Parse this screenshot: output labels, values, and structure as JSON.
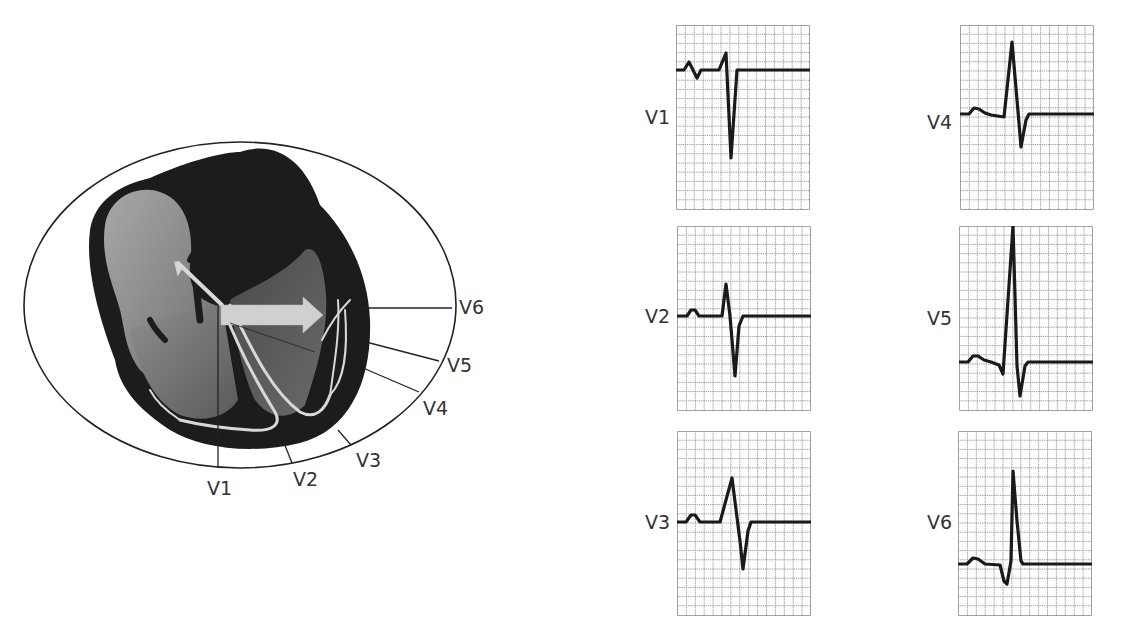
{
  "colors": {
    "background": "#ffffff",
    "outline": "#222222",
    "heart_wall": "#1c1c1c",
    "chamber_light": "#9a9a9a",
    "chamber_dark": "#5e5e5e",
    "conduction": "#d8d8d8",
    "arrow": "#d0d0d0",
    "grid": "#8a8a8a",
    "trace": "#1a1a1a",
    "label": "#333333"
  },
  "heart_diagram": {
    "description": "Cross-section of heart within chest ellipse; arrow showing mean electrical vector toward left ventricle; radial lines to chest leads",
    "leads": [
      {
        "id": "V1",
        "label": "V1"
      },
      {
        "id": "V2",
        "label": "V2"
      },
      {
        "id": "V3",
        "label": "V3"
      },
      {
        "id": "V4",
        "label": "V4"
      },
      {
        "id": "V5",
        "label": "V5"
      },
      {
        "id": "V6",
        "label": "V6"
      }
    ]
  },
  "ecg_strips": [
    {
      "id": "V1",
      "label": "V1",
      "morphology": "small r, deep S (rS)"
    },
    {
      "id": "V2",
      "label": "V2",
      "morphology": "r slightly larger, deep S"
    },
    {
      "id": "V3",
      "label": "V3",
      "morphology": "R and S roughly equal (transition)"
    },
    {
      "id": "V4",
      "label": "V4",
      "morphology": "tall R, smaller S"
    },
    {
      "id": "V5",
      "label": "V5",
      "morphology": "small q, very tall R, small S"
    },
    {
      "id": "V6",
      "label": "V6",
      "morphology": "q, tall R, no S (qR)"
    }
  ],
  "grid": {
    "columns": 15,
    "rows": 20
  }
}
